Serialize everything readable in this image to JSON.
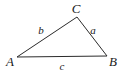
{
  "figure": {
    "kind": "triangle-diagram",
    "background_color": "#ffffff",
    "stroke_color": "#2b2b2b",
    "stroke_width": 1,
    "text_color": "#1a1a1a",
    "vertices": [
      {
        "name": "A",
        "label": "A",
        "x": 17,
        "y": 57,
        "label_x": 10,
        "label_y": 61
      },
      {
        "name": "B",
        "label": "B",
        "x": 107,
        "y": 56,
        "label_x": 113,
        "label_y": 61
      },
      {
        "name": "C",
        "label": "C",
        "x": 77,
        "y": 17,
        "label_x": 76,
        "label_y": 8
      }
    ],
    "sides": [
      {
        "name": "a",
        "label": "a",
        "between": "C-B",
        "label_x": 93,
        "label_y": 30
      },
      {
        "name": "b",
        "label": "b",
        "between": "A-C",
        "label_x": 41,
        "label_y": 30
      },
      {
        "name": "c",
        "label": "c",
        "between": "A-B",
        "label_x": 62,
        "label_y": 66
      }
    ]
  }
}
